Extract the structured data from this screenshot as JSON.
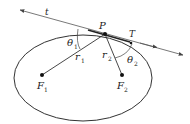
{
  "diagram": {
    "colors": {
      "stroke": "#333333",
      "text": "#222222",
      "background": "#ffffff"
    },
    "labels": {
      "tangent_line": "t",
      "point": "P",
      "tangent_marker": "T",
      "theta1_base": "θ",
      "theta1_sub": "1",
      "theta2_base": "θ",
      "theta2_sub": "2",
      "r1_base": "r",
      "r1_sub": "1",
      "r2_base": "r",
      "r2_sub": "2",
      "f1_base": "F",
      "f1_sub": "1",
      "f2_base": "F",
      "f2_sub": "2"
    }
  }
}
